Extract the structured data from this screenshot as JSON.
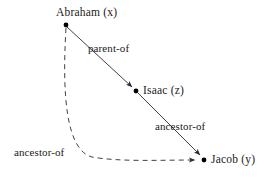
{
  "diagram": {
    "background_color": "#ffffff",
    "line_color": "#2b2b2b",
    "node_color": "#000000",
    "nodes": [
      {
        "id": "abraham",
        "label": "Abraham (x)",
        "x": 66,
        "y": 25
      },
      {
        "id": "isaac",
        "label": "Isaac (z)",
        "x": 136,
        "y": 91
      },
      {
        "id": "jacob",
        "label": "Jacob (y)",
        "x": 204,
        "y": 160
      }
    ],
    "edges": [
      {
        "id": "abraham-isaac",
        "from": "abraham",
        "to": "isaac",
        "label": "parent-of",
        "style": "solid",
        "arrow": true
      },
      {
        "id": "isaac-jacob",
        "from": "isaac",
        "to": "jacob",
        "label": "ancestor-of",
        "style": "solid",
        "arrow": true
      },
      {
        "id": "abraham-jacob",
        "from": "abraham",
        "to": "jacob",
        "label": "ancestor-of",
        "style": "dashed",
        "arrow": true
      }
    ]
  }
}
